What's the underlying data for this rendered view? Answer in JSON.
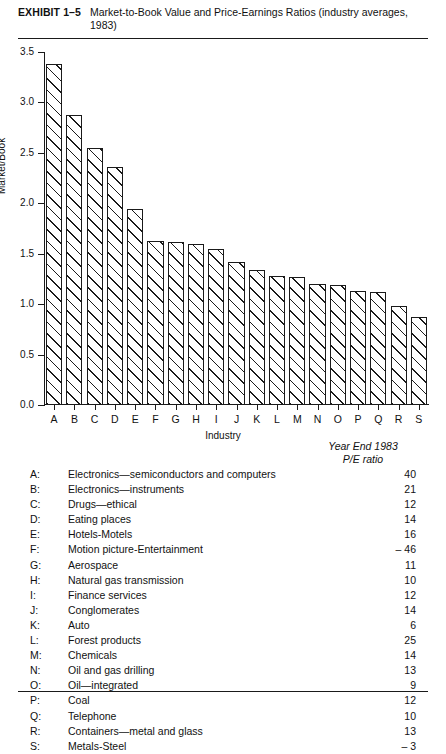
{
  "exhibit": {
    "tag": "EXHIBIT 1–5",
    "title": "Market-to-Book Value and Price-Earnings Ratios (industry averages, 1983)"
  },
  "chart_data": {
    "type": "bar",
    "title": "Market-to-Book Value and Price-Earnings Ratios (industry averages, 1983)",
    "xlabel": "Industry",
    "ylabel": "Market/Book",
    "ylim": [
      0.0,
      3.5
    ],
    "yticks": [
      "0.0",
      "0.5",
      "1.0",
      "1.5",
      "2.0",
      "2.5",
      "3.0",
      "3.5"
    ],
    "grid": false,
    "legend": "none",
    "categories": [
      "A",
      "B",
      "C",
      "D",
      "E",
      "F",
      "G",
      "H",
      "I",
      "J",
      "K",
      "L",
      "M",
      "N",
      "O",
      "P",
      "Q",
      "R",
      "S"
    ],
    "values": [
      3.38,
      2.88,
      2.55,
      2.36,
      1.94,
      1.63,
      1.62,
      1.6,
      1.55,
      1.42,
      1.34,
      1.28,
      1.27,
      1.2,
      1.19,
      1.13,
      1.12,
      0.98,
      0.87
    ]
  },
  "legend_table": {
    "header_line1": "Year End 1983",
    "header_line2": "P/E ratio",
    "rows": [
      {
        "key": "A:",
        "name": "Electronics—semiconductors and computers",
        "pe": "40"
      },
      {
        "key": "B:",
        "name": "Electronics—instruments",
        "pe": "21"
      },
      {
        "key": "C:",
        "name": "Drugs—ethical",
        "pe": "12"
      },
      {
        "key": "D:",
        "name": "Eating places",
        "pe": "14"
      },
      {
        "key": "E:",
        "name": "Hotels-Motels",
        "pe": "16"
      },
      {
        "key": "F:",
        "name": "Motion picture-Entertainment",
        "pe": "– 46"
      },
      {
        "key": "G:",
        "name": "Aerospace",
        "pe": "11"
      },
      {
        "key": "H:",
        "name": "Natural gas transmission",
        "pe": "10"
      },
      {
        "key": "I:",
        "name": "Finance services",
        "pe": "12"
      },
      {
        "key": "J:",
        "name": "Conglomerates",
        "pe": "14"
      },
      {
        "key": "K:",
        "name": "Auto",
        "pe": "6"
      },
      {
        "key": "L:",
        "name": "Forest products",
        "pe": "25"
      },
      {
        "key": "M:",
        "name": "Chemicals",
        "pe": "14"
      },
      {
        "key": "N:",
        "name": "Oil and gas drilling",
        "pe": "13"
      },
      {
        "key": "O:",
        "name": "Oil—integrated",
        "pe": "9"
      },
      {
        "key": "P:",
        "name": "Coal",
        "pe": "12"
      },
      {
        "key": "Q:",
        "name": "Telephone",
        "pe": "10"
      },
      {
        "key": "R:",
        "name": "Containers—metal and glass",
        "pe": "13"
      },
      {
        "key": "S:",
        "name": "Metals-Steel",
        "pe": "– 3"
      }
    ]
  }
}
